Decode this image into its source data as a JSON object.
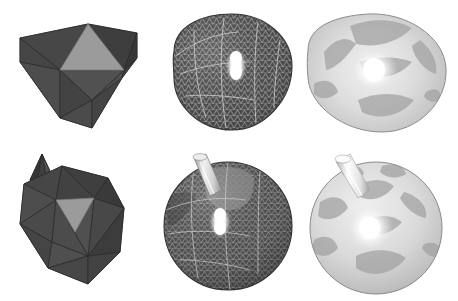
{
  "figure": {
    "background_color": "#ffffff",
    "layout": {
      "rows": 2,
      "columns": 3,
      "width": 458,
      "height": 301
    },
    "colors": {
      "dark_facet": "#4a4a4a",
      "dark_facet_shade": "#3c3c3c",
      "dark_facet_light": "#565656",
      "highlight_facet": "#9a9a9a",
      "highlight_facet_dark": "#8a8a8a",
      "mesh_wire": "#c9c9c9",
      "mesh_body": "#555555",
      "smooth_light": "#d8d8d8",
      "smooth_mid": "#bdbdbd",
      "smooth_patch": "#9e9e9e",
      "specular": "#ffffff",
      "spike_light": "#dcdcdc",
      "spike_dark": "#454545",
      "outline": "#2e2e2e"
    },
    "panels": [
      {
        "id": "top-left",
        "name": "base-polyhedron-irregular",
        "row": 1,
        "column": 1,
        "render_style": "flat-shaded polyhedron",
        "shape": "irregular icosahedral control mesh",
        "features": [
          "dark triangular facets",
          "one light gray triangular facet",
          "visible edges"
        ],
        "has_spike": false,
        "has_specular_highlight": false,
        "bounds": {
          "x": 12,
          "y": 20,
          "width": 126,
          "height": 112
        }
      },
      {
        "id": "top-middle",
        "name": "wireframe-subdivision-blob",
        "row": 1,
        "column": 2,
        "render_style": "dense triangular wireframe over shaded surface",
        "shape": "teardrop / egg-shaped blob",
        "features": [
          "fine triangular mesh lines",
          "white specular highlight",
          "quadrilateral patch boundary"
        ],
        "has_spike": false,
        "has_specular_highlight": true,
        "bounds": {
          "x": 163,
          "y": 12,
          "width": 132,
          "height": 128
        }
      },
      {
        "id": "top-right",
        "name": "smooth-shaded-blob",
        "row": 1,
        "column": 3,
        "render_style": "smooth Phong-shaded surface",
        "shape": "teardrop / egg-shaped blob",
        "features": [
          "light gray body",
          "darker curved triangular patches",
          "bright central specular highlight"
        ],
        "has_spike": false,
        "has_specular_highlight": true,
        "bounds": {
          "x": 305,
          "y": 12,
          "width": 145,
          "height": 128
        }
      },
      {
        "id": "bottom-left",
        "name": "base-polyhedron-with-spike",
        "row": 2,
        "column": 1,
        "render_style": "flat-shaded polyhedron",
        "shape": "regular icosahedral control mesh",
        "features": [
          "dark triangular facets",
          "one inverted light gray triangular facet",
          "protruding spike at upper left"
        ],
        "has_spike": true,
        "has_specular_highlight": false,
        "bounds": {
          "x": 18,
          "y": 152,
          "width": 122,
          "height": 132
        }
      },
      {
        "id": "bottom-middle",
        "name": "wireframe-subdivision-sphere-with-spike",
        "row": 2,
        "column": 2,
        "render_style": "dense triangular wireframe over shaded surface",
        "shape": "sphere",
        "features": [
          "fine triangular mesh lines",
          "light gray spike tube",
          "lighter spherical triangle patch",
          "white specular highlight"
        ],
        "has_spike": true,
        "has_specular_highlight": true,
        "bounds": {
          "x": 165,
          "y": 155,
          "width": 130,
          "height": 138
        }
      },
      {
        "id": "bottom-right",
        "name": "smooth-shaded-sphere-with-spike",
        "row": 2,
        "column": 3,
        "render_style": "smooth Phong-shaded surface",
        "shape": "sphere",
        "features": [
          "light gray body",
          "star arrangement of dark triangular patches",
          "white spike tube",
          "bright specular highlight"
        ],
        "has_spike": true,
        "has_specular_highlight": true,
        "bounds": {
          "x": 312,
          "y": 155,
          "width": 132,
          "height": 138
        }
      }
    ]
  }
}
